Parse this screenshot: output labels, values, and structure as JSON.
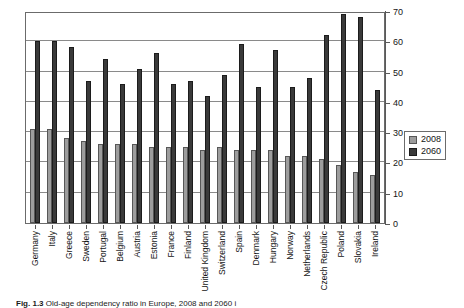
{
  "chart_data": {
    "type": "bar",
    "title": "",
    "xlabel": "",
    "ylabel": "",
    "ylim": [
      0,
      70
    ],
    "yticks": [
      0,
      10,
      20,
      30,
      40,
      50,
      60,
      70
    ],
    "grid": true,
    "legend_position": "right",
    "categories": [
      "Germany",
      "Italy",
      "Greece",
      "Sweden",
      "Portugal",
      "Belgium",
      "Austria",
      "Estonia",
      "France",
      "Finland",
      "United Kingdom",
      "Switzerland",
      "Spain",
      "Denmark",
      "Hungary",
      "Norway",
      "Netherlands",
      "Czech Republic",
      "Poland",
      "Slovakia",
      "Ireland"
    ],
    "series": [
      {
        "name": "2008",
        "color": "#9d9d9d",
        "values": [
          31,
          31,
          28,
          27,
          26,
          26,
          26,
          25,
          25,
          25,
          24,
          25,
          24,
          24,
          24,
          22,
          22,
          21,
          19,
          17,
          16
        ]
      },
      {
        "name": "2060",
        "color": "#3a3a3a",
        "values": [
          60,
          60,
          58,
          47,
          54,
          46,
          51,
          56,
          46,
          47,
          42,
          49,
          59,
          45,
          57,
          45,
          48,
          62,
          69,
          68,
          44
        ]
      }
    ]
  },
  "legend": {
    "items": [
      {
        "label": "2008",
        "color": "#9d9d9d"
      },
      {
        "label": "2060",
        "color": "#3a3a3a"
      }
    ]
  },
  "caption": {
    "number": "Fig. 1.3",
    "text": "Old-age dependency ratio in Europe, 2008 and 2060 i"
  }
}
